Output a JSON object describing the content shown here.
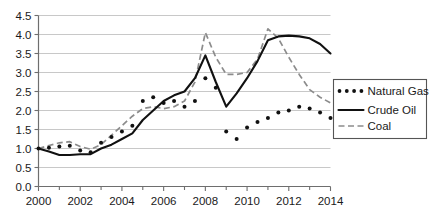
{
  "chart_data": {
    "type": "line",
    "title": "",
    "xlabel": "",
    "ylabel": "",
    "xlim": [
      2000,
      2014
    ],
    "ylim": [
      0.0,
      4.5
    ],
    "ytick_labels": [
      "0.0",
      "0.5",
      "1.0",
      "1.5",
      "2.0",
      "2.5",
      "3.0",
      "3.5",
      "4.0",
      "4.5"
    ],
    "ytick_values": [
      0.0,
      0.5,
      1.0,
      1.5,
      2.0,
      2.5,
      3.0,
      3.5,
      4.0,
      4.5
    ],
    "xtick_labels": [
      "2000",
      "2002",
      "2004",
      "2006",
      "2008",
      "2010",
      "2012",
      "2014"
    ],
    "xtick_values": [
      2000,
      2002,
      2004,
      2006,
      2008,
      2010,
      2012,
      2014
    ],
    "minor_xtick_values": [
      2001,
      2003,
      2005,
      2007,
      2009,
      2011,
      2013
    ],
    "grid": "horizontal",
    "legend_position": "right",
    "x": [
      2000,
      2000.5,
      2001,
      2001.5,
      2002,
      2002.5,
      2003,
      2003.5,
      2004,
      2004.5,
      2005,
      2005.5,
      2006,
      2006.5,
      2007,
      2007.5,
      2008,
      2008.5,
      2009,
      2009.5,
      2010,
      2010.5,
      2011,
      2011.5,
      2012,
      2012.5,
      2013,
      2013.5,
      2014
    ],
    "series": [
      {
        "name": "Natural Gas",
        "style": "dotted",
        "color": "#111111",
        "values": [
          1.0,
          1.02,
          1.05,
          1.07,
          0.95,
          0.9,
          1.15,
          1.3,
          1.45,
          1.6,
          2.25,
          2.35,
          2.2,
          2.25,
          2.1,
          2.25,
          2.85,
          2.6,
          1.45,
          1.25,
          1.55,
          1.7,
          1.8,
          1.95,
          2.0,
          2.1,
          2.05,
          1.95,
          1.8
        ]
      },
      {
        "name": "Crude Oil",
        "style": "solid",
        "color": "#111111",
        "values": [
          1.0,
          0.92,
          0.83,
          0.83,
          0.85,
          0.85,
          1.0,
          1.1,
          1.25,
          1.4,
          1.75,
          2.0,
          2.25,
          2.4,
          2.5,
          2.85,
          3.45,
          2.75,
          2.1,
          2.45,
          2.85,
          3.3,
          3.85,
          3.95,
          3.97,
          3.95,
          3.9,
          3.75,
          3.5
        ]
      },
      {
        "name": "Coal",
        "style": "dashed",
        "color": "#8c8c8c",
        "values": [
          1.0,
          1.08,
          1.15,
          1.18,
          1.05,
          0.98,
          1.1,
          1.35,
          1.6,
          1.85,
          2.05,
          2.1,
          2.05,
          2.1,
          2.25,
          2.75,
          4.05,
          3.4,
          2.95,
          2.95,
          3.0,
          3.35,
          4.15,
          3.9,
          3.4,
          2.95,
          2.55,
          2.35,
          2.2
        ]
      }
    ]
  },
  "legend": {
    "items": [
      {
        "label": "Natural Gas",
        "marker": "dotted-line-marker"
      },
      {
        "label": "Crude Oil",
        "marker": "solid-line-marker"
      },
      {
        "label": "Coal",
        "marker": "dashed-line-marker"
      }
    ]
  }
}
